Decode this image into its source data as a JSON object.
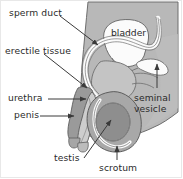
{
  "figure": {
    "type": "anatomical-diagram",
    "width": 183,
    "height": 179,
    "background_color": "#ffffff",
    "border_color": "#e8e8e8"
  },
  "colors": {
    "body_fill": "#b8b8b8",
    "body_edge": "#6e6e6e",
    "organ_white": "#fbfbfb",
    "testis_fill": "#8e8e8e",
    "scrotum_fill": "#a8a8a8",
    "erectile_fill": "#9a9a9a",
    "urethra_fill": "#c9c9c9",
    "line": "#4a4a4a",
    "text": "#2b2b2b"
  },
  "labels": {
    "sperm_duct": "sperm duct",
    "erectile_tissue": "erectile tissue",
    "urethra": "urethra",
    "penis": "penis",
    "testis": "testis",
    "scrotum": "scrotum",
    "bladder": "bladder",
    "seminal_vesicle": "seminal vesicle"
  },
  "structures": [
    {
      "name": "sperm-duct",
      "label": "sperm duct",
      "leader": "diagonal-arrow",
      "label_side": "left"
    },
    {
      "name": "erectile-tissue",
      "label": "erectile tissue",
      "leader": "diagonal-arrow",
      "label_side": "left"
    },
    {
      "name": "urethra",
      "label": "urethra",
      "leader": "horizontal-arrow",
      "label_side": "left"
    },
    {
      "name": "penis",
      "label": "penis",
      "leader": "horizontal-arrow",
      "label_side": "left"
    },
    {
      "name": "testis",
      "label": "testis",
      "leader": "diagonal-arrow",
      "label_side": "bottom-left"
    },
    {
      "name": "scrotum",
      "label": "scrotum",
      "leader": "vertical-arrow",
      "label_side": "bottom"
    },
    {
      "name": "bladder",
      "label": "bladder",
      "leader": "none",
      "label_side": "inside"
    },
    {
      "name": "seminal-vesicle",
      "label": "seminal vesicle",
      "leader": "vertical-arrow",
      "label_side": "right"
    }
  ]
}
